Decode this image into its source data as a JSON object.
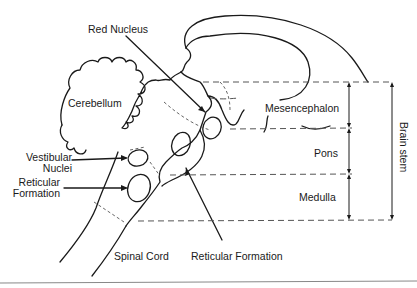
{
  "diagram": {
    "colors": {
      "line": "#1a1a1a",
      "dashed": "#555555",
      "background": "#ffffff",
      "rule": "#888888"
    },
    "labels": {
      "red_nucleus": "Red Nucleus",
      "cerebellum": "Cerebellum",
      "mesencephalon": "Mesencephalon",
      "pons": "Pons",
      "medulla": "Medulla",
      "brain_stem": "Brain stem",
      "vestibular_nuclei_line1": "Vestibular",
      "vestibular_nuclei_line2": "Nuclei",
      "reticular_formation_left_line1": "Reticular",
      "reticular_formation_left_line2": "Formation",
      "spinal_cord": "Spinal Cord",
      "reticular_formation_bottom": "Reticular Formation"
    },
    "regions": [
      {
        "name": "Mesencephalon",
        "span": "top"
      },
      {
        "name": "Pons",
        "span": "middle"
      },
      {
        "name": "Medulla",
        "span": "bottom"
      }
    ],
    "brace_label": "Brain stem"
  }
}
